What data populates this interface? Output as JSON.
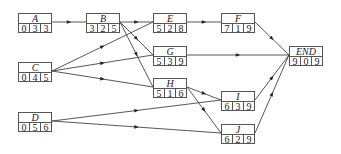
{
  "diagram": {
    "type": "activity-on-node network",
    "nodes": [
      {
        "id": "A",
        "label": "A",
        "values": [
          "0",
          "3",
          "3"
        ],
        "x": 18,
        "y": 13
      },
      {
        "id": "B",
        "label": "B",
        "values": [
          "3",
          "2",
          "5"
        ],
        "x": 86,
        "y": 13
      },
      {
        "id": "E",
        "label": "E",
        "values": [
          "5",
          "2",
          "8"
        ],
        "x": 153,
        "y": 13
      },
      {
        "id": "F",
        "label": "F",
        "values": [
          "7",
          "1",
          "9"
        ],
        "x": 221,
        "y": 13
      },
      {
        "id": "C",
        "label": "C",
        "values": [
          "0",
          "4",
          "5"
        ],
        "x": 18,
        "y": 62
      },
      {
        "id": "G",
        "label": "G",
        "values": [
          "5",
          "3",
          "9"
        ],
        "x": 153,
        "y": 46
      },
      {
        "id": "H",
        "label": "H",
        "values": [
          "5",
          "1",
          "6"
        ],
        "x": 153,
        "y": 78
      },
      {
        "id": "END",
        "label": "END",
        "values": [
          "9",
          "0",
          "9"
        ],
        "x": 289,
        "y": 46
      },
      {
        "id": "D",
        "label": "D",
        "values": [
          "0",
          "5",
          "6"
        ],
        "x": 18,
        "y": 112
      },
      {
        "id": "I",
        "label": "I",
        "values": [
          "6",
          "3",
          "9"
        ],
        "x": 221,
        "y": 91
      },
      {
        "id": "J",
        "label": "J",
        "values": [
          "6",
          "2",
          "9"
        ],
        "x": 221,
        "y": 124
      }
    ],
    "edges": [
      {
        "from": "A",
        "to": "B"
      },
      {
        "from": "B",
        "to": "E"
      },
      {
        "from": "B",
        "to": "G"
      },
      {
        "from": "B",
        "to": "H"
      },
      {
        "from": "C",
        "to": "E"
      },
      {
        "from": "C",
        "to": "G"
      },
      {
        "from": "C",
        "to": "H"
      },
      {
        "from": "D",
        "to": "I"
      },
      {
        "from": "D",
        "to": "J"
      },
      {
        "from": "E",
        "to": "F"
      },
      {
        "from": "F",
        "to": "END"
      },
      {
        "from": "G",
        "to": "END"
      },
      {
        "from": "H",
        "to": "I"
      },
      {
        "from": "H",
        "to": "J"
      },
      {
        "from": "I",
        "to": "END"
      },
      {
        "from": "J",
        "to": "END"
      }
    ],
    "colors": {
      "line": "#444444",
      "box_border": "#555555",
      "text": "#222222"
    }
  }
}
